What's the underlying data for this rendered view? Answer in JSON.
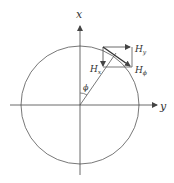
{
  "diagram": {
    "type": "field-vector-decomposition",
    "axes": {
      "vertical": {
        "label": "x"
      },
      "horizontal": {
        "label": "y"
      }
    },
    "angle": {
      "label": "ϕ"
    },
    "vectors": [
      {
        "name": "H_phi",
        "label": "H",
        "subscript": "ϕ",
        "description": "tangential field vector"
      },
      {
        "name": "H_x",
        "label": "H",
        "subscript": "x",
        "description": "x component (downward)"
      },
      {
        "name": "H_y",
        "label": "H",
        "subscript": "y",
        "description": "y component (rightward)"
      }
    ],
    "colors": {
      "stroke": "#555555",
      "text": "#333333",
      "background": "#ffffff"
    }
  }
}
